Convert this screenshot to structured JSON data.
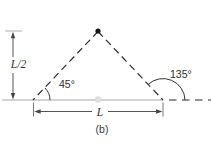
{
  "diagram": {
    "caption": "(b)",
    "labels": {
      "height_dimension": "L/2",
      "base_dimension": "L",
      "left_angle": "45°",
      "right_angle": "135°"
    },
    "markers": {
      "apex_point": "filled-black-dot",
      "base_midpoint": "light-gray-dot"
    },
    "colors": {
      "dashed_line": "#2b2b2b",
      "baseline_gray": "#c4c4c4",
      "dimension_gray": "#555555",
      "arc_stroke": "#333333",
      "background": "#ffffff"
    }
  }
}
